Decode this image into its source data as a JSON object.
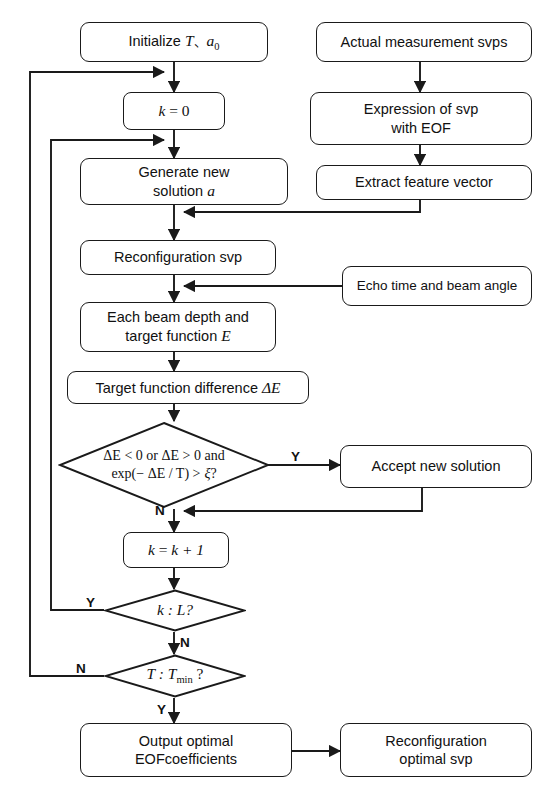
{
  "diagram": {
    "type": "flowchart",
    "width": 542,
    "height": 798,
    "stroke_color": "#1a1a1a",
    "background_color": "#ffffff"
  },
  "nodes": {
    "initialize": {
      "label": "Initialize",
      "var_t": "T",
      "separator": "、",
      "var_a": "a",
      "var_a_sub": "0"
    },
    "k_zero": {
      "lhs": "k",
      "eq": "=",
      "rhs": "0"
    },
    "generate": {
      "line1": "Generate new",
      "line2": "solution",
      "var": "a"
    },
    "reconfiguration_svp": {
      "label": "Reconfiguration svp"
    },
    "each_beam": {
      "line1": "Each beam depth and",
      "line2": "target function",
      "var": "E"
    },
    "target_diff": {
      "label": "Target function difference",
      "var": "ΔE"
    },
    "decision_energy": {
      "line1": "ΔE < 0  or ΔE > 0  and",
      "line2_prefix": "exp(− ΔE / T) >",
      "line2_var": "ξ",
      "line2_suffix": "?"
    },
    "accept": {
      "label": "Accept new solution"
    },
    "k_increment": {
      "lhs": "k",
      "eq": "=",
      "rhs": "k + 1"
    },
    "decision_k": {
      "label": "k :  L?"
    },
    "decision_t": {
      "label": "T :  T",
      "sub": "min",
      "suffix": "?"
    },
    "output_optimal": {
      "line1": "Output optimal",
      "line2": "EOFcoefficients"
    },
    "actual_measurement": {
      "label": "Actual measurement svps"
    },
    "expression_eof": {
      "line1": "Expression of svp",
      "line2": "with EOF"
    },
    "extract_feature": {
      "label": "Extract feature vector"
    },
    "echo_time": {
      "label": "Echo time and beam angle"
    },
    "reconfiguration_optimal": {
      "line1": "Reconfiguration",
      "line2": "optimal svp"
    }
  },
  "branch_labels": {
    "energy_yes": "Y",
    "energy_no": "N",
    "k_yes": "Y",
    "k_no": "N",
    "t_no": "N",
    "t_yes": "Y"
  }
}
